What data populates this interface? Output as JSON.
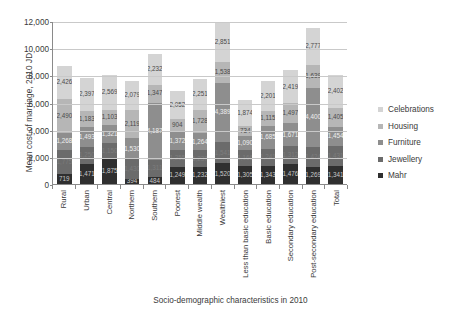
{
  "chart_data": {
    "type": "bar",
    "stacked": true,
    "title": "",
    "xlabel": "Socio-demographic characteristics in 2010",
    "ylabel": "Mean cost of marriage, 2010 JD",
    "ylim": [
      0,
      12000
    ],
    "yticks": [
      "0",
      "2,000",
      "4,000",
      "6,000",
      "8,000",
      "10,000",
      "12,000"
    ],
    "ytick_values": [
      0,
      2000,
      4000,
      6000,
      8000,
      10000,
      12000
    ],
    "grid": true,
    "legend_position": "right",
    "categories": [
      "Rural",
      "Urban",
      "Central",
      "Northern",
      "Southern",
      "Poorest",
      "Middle wealth",
      "Wealthiest",
      "Less than basic education",
      "Basic education",
      "Secondary education",
      "Post-secondary education",
      "Total"
    ],
    "series": [
      {
        "name": "Mahr",
        "color": "#2f2f2f",
        "values": [
          719,
          1471,
          1875,
          394,
          484,
          1249,
          1232,
          1520,
          1305,
          1343,
          1476,
          1269,
          1341
        ]
      },
      {
        "name": "Jewellery",
        "color": "#6b6b6b",
        "values": [
          1775,
          1250,
          1150,
          1430,
          1311,
          1255,
          1237,
          1541,
          1166,
          1241,
          1312,
          1424,
          1431
        ]
      },
      {
        "name": "Furniture",
        "color": "#8e8e8e",
        "values": [
          1268,
          1493,
          1321,
          1530,
          4187,
          1372,
          1264,
          4389,
          1090,
          1685,
          1671,
          4400,
          1454
        ]
      },
      {
        "name": "Housing",
        "color": "#b6b6b6",
        "values": [
          2490,
          1183,
          1103,
          2119,
          1347,
          904,
          1728,
          1538,
          734,
          1115,
          1497,
          1639,
          1405
        ]
      },
      {
        "name": "Celebrations",
        "color": "#d4d4d4",
        "values": [
          2426,
          2397,
          2569,
          2079,
          2232,
          2052,
          2251,
          2851,
          1874,
          2201,
          2419,
          2777,
          2402
        ]
      }
    ],
    "legend_order": [
      "Celebrations",
      "Housing",
      "Furniture",
      "Jewellery",
      "Mahr"
    ]
  }
}
